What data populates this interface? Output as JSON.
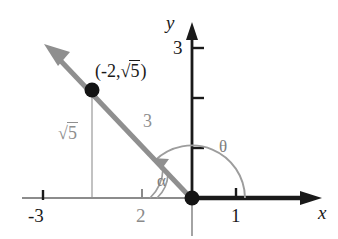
{
  "figure": {
    "type": "coordinate-plane-diagram",
    "background_color": "#ffffff",
    "axis_color": "#1a1a1a",
    "ray_color": "#8f8f8f",
    "annotation_color": "#8a8a8a"
  },
  "axes": {
    "x_label": "x",
    "y_label": "y",
    "x_ticks": [
      {
        "label": "-3",
        "value": -3,
        "px": 43,
        "style": "dark"
      },
      {
        "label": "2",
        "value": -2,
        "px": 142,
        "style": "gray"
      },
      {
        "label": "1",
        "value": 1,
        "px": 236,
        "style": "dark"
      }
    ],
    "y_ticks": [
      {
        "label": "3",
        "value": 3,
        "px": 48,
        "style": "dark"
      },
      {
        "label": "",
        "value": 2,
        "px": 98,
        "style": "dark"
      },
      {
        "label": "",
        "value": 1,
        "px": 148,
        "style": "dark"
      }
    ],
    "origin_px": {
      "x": 192,
      "y": 198
    }
  },
  "point": {
    "label_x": "(-2,",
    "label_radicand": "5",
    "label_close": ")",
    "coords": {
      "x": -2,
      "y": 2.236
    },
    "px": {
      "x": 92,
      "y": 90
    }
  },
  "segments": {
    "radius_label": "3",
    "radius_value": 3,
    "height_radicand": "5",
    "height_label": "sqrt5"
  },
  "angles": {
    "theta_label": "θ",
    "alpha_label": "α"
  },
  "icons": {
    "ray_arrow": "arrow-up-left-icon",
    "x_axis_arrow": "arrow-right-icon",
    "y_axis_arrow": "arrow-up-icon",
    "theta_arc_arrow": "arc-arrow-icon",
    "point_dot": "filled-circle-icon",
    "origin_dot": "filled-circle-icon"
  }
}
